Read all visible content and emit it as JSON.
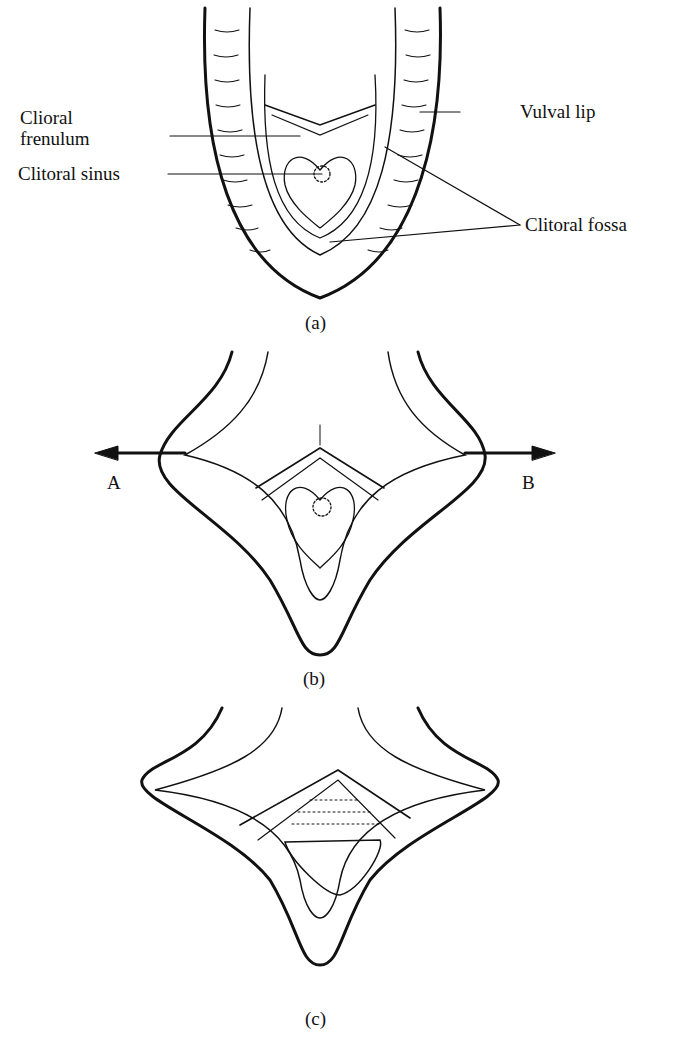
{
  "panels": [
    {
      "id": "a",
      "caption": "(a)",
      "labels": {
        "frenulum_1": "Clioral",
        "frenulum_2": "frenulum",
        "sinus": "Clitoral sinus",
        "lip": "Vulval lip",
        "fossa": "Clitoral fossa"
      }
    },
    {
      "id": "b",
      "caption": "(b)",
      "labels": {
        "arrow_left": "A",
        "arrow_right": "B"
      }
    },
    {
      "id": "c",
      "caption": "(c)"
    }
  ],
  "colors": {
    "ink": "#111111",
    "background": "#ffffff"
  }
}
